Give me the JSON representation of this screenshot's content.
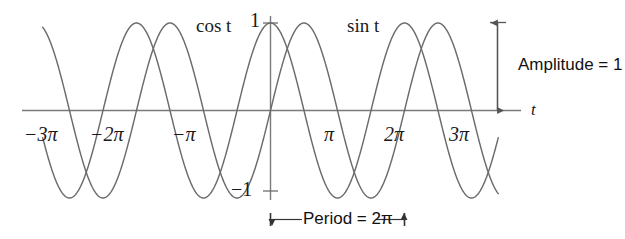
{
  "figure": {
    "background": "#ffffff",
    "curve_color": "#6b6b6b",
    "axis_color": "#7a7a7a",
    "text_color": "#1a1a1a",
    "annotation_color": "#111111"
  },
  "axes": {
    "x_axis_name": "t",
    "y_value_top": "1",
    "y_value_bottom": "−1",
    "tick_labels": [
      {
        "text": "−3π",
        "value": -9.4248
      },
      {
        "text": "−2π",
        "value": -6.2832
      },
      {
        "text": "−π",
        "value": -3.1416
      },
      {
        "text": "π",
        "value": 3.1416
      },
      {
        "text": "2π",
        "value": 6.2832
      },
      {
        "text": "3π",
        "value": 9.4248
      }
    ]
  },
  "curve_labels": {
    "cos": "cos t",
    "sin": "sin t"
  },
  "annotations": {
    "amplitude": "Amplitude = 1",
    "period": "Period = 2π"
  },
  "chart_data": {
    "type": "line",
    "title": "",
    "subtitle": "",
    "xlabel": "t",
    "ylabel": "",
    "xlim": [
      -10.68,
      10.68
    ],
    "ylim": [
      -1.12,
      1.12
    ],
    "grid": false,
    "legend": "inline-curve-labels",
    "x_ticks": [
      -9.4248,
      -6.2832,
      -3.1416,
      3.1416,
      6.2832,
      9.4248
    ],
    "x_tick_labels": [
      "−3π",
      "−2π",
      "−π",
      "π",
      "2π",
      "3π"
    ],
    "y_ticks": [
      -1,
      1
    ],
    "y_tick_labels": [
      "−1",
      "1"
    ],
    "series": [
      {
        "name": "cos t",
        "function": "cos",
        "amplitude": 1,
        "period": 6.2832,
        "phase": 0,
        "color": "#6b6b6b",
        "domain": [
          -10.68,
          10.68
        ],
        "label_position": {
          "x": -2.0,
          "y": 1.12
        }
      },
      {
        "name": "sin t",
        "function": "sin",
        "amplitude": 1,
        "period": 6.2832,
        "phase": 0,
        "color": "#6b6b6b",
        "domain": [
          -10.68,
          10.68
        ],
        "label_position": {
          "x": 2.5,
          "y": 1.12
        }
      }
    ],
    "annotations": [
      {
        "kind": "double-arrow-vertical",
        "label": "Amplitude = 1",
        "from_y": 0,
        "to_y": 1,
        "at_x": 10.45
      },
      {
        "kind": "double-arrow-horizontal",
        "label": "Period = 2π",
        "from_x": 0,
        "to_x": 6.2832,
        "at_y": -1.35
      }
    ]
  }
}
